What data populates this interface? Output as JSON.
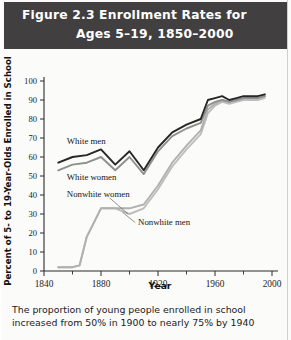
{
  "figure": {
    "title_line1": "Figure 2.3  Enrollment Rates for",
    "title_line2": "Ages 5–19, 1850–2000",
    "caption_line1": "The proportion of young people enrolled in school",
    "caption_line2": "increased from 50% in 1900 to nearly 75% by 1940",
    "header_bg": "#413f3f",
    "header_fg": "#ffffff"
  },
  "chart_data": {
    "type": "line",
    "title": "Figure 2.3  Enrollment Rates for Ages 5–19, 1850–2000",
    "xlabel": "Year",
    "ylabel": "Percent of 5- to 19-Year-Olds Enrolled in School",
    "xlim": [
      1840,
      2000
    ],
    "ylim": [
      0,
      100
    ],
    "xticks": [
      1840,
      1880,
      1920,
      1960,
      2000
    ],
    "xticks_minor": [
      1860,
      1900,
      1940,
      1980
    ],
    "yticks": [
      0,
      10,
      20,
      30,
      40,
      50,
      60,
      70,
      80,
      90,
      100
    ],
    "grid": false,
    "legend": "inline-labels",
    "series": [
      {
        "name": "White men",
        "color": "#262626",
        "width": 1.9,
        "x": [
          1850,
          1860,
          1870,
          1880,
          1890,
          1900,
          1910,
          1920,
          1930,
          1940,
          1950,
          1955,
          1960,
          1965,
          1970,
          1975,
          1980,
          1985,
          1990,
          1995
        ],
        "y": [
          57,
          60,
          61,
          64,
          56,
          63,
          53,
          65,
          73,
          77,
          80,
          90,
          91,
          92,
          90,
          91,
          92,
          92,
          92,
          93
        ]
      },
      {
        "name": "White women",
        "color": "#8f8f8f",
        "width": 1.9,
        "x": [
          1850,
          1860,
          1870,
          1880,
          1890,
          1900,
          1910,
          1920,
          1930,
          1940,
          1950,
          1955,
          1960,
          1965,
          1970,
          1975,
          1980,
          1985,
          1990,
          1995
        ],
        "y": [
          53,
          56,
          57,
          60,
          53,
          60,
          51,
          63,
          71,
          75,
          78,
          87,
          89,
          90,
          89,
          90,
          91,
          91,
          91,
          92
        ]
      },
      {
        "name": "Nonwhite women",
        "color": "#b0b0b0",
        "width": 1.9,
        "x": [
          1850,
          1860,
          1865,
          1870,
          1880,
          1890,
          1900,
          1910,
          1920,
          1930,
          1940,
          1950,
          1955,
          1960,
          1965,
          1970,
          1975,
          1980,
          1985,
          1990,
          1995
        ],
        "y": [
          2,
          2,
          3,
          18,
          33,
          33,
          33,
          35,
          45,
          57,
          66,
          74,
          85,
          88,
          90,
          89,
          90,
          91,
          91,
          91,
          92
        ]
      },
      {
        "name": "Nonwhite men",
        "color": "#bdbdbd",
        "width": 1.9,
        "x": [
          1850,
          1860,
          1865,
          1870,
          1880,
          1890,
          1900,
          1910,
          1920,
          1930,
          1940,
          1950,
          1955,
          1960,
          1965,
          1970,
          1975,
          1980,
          1985,
          1990,
          1995
        ],
        "y": [
          2,
          2,
          3,
          18,
          33,
          33,
          30,
          33,
          43,
          55,
          64,
          72,
          83,
          87,
          89,
          88,
          89,
          90,
          90,
          90,
          91
        ]
      }
    ],
    "annotations": [
      {
        "text": "White men",
        "x": 1856,
        "y": 67
      },
      {
        "text": "White women",
        "x": 1856,
        "y": 48
      },
      {
        "text": "Nonwhite women",
        "x": 1856,
        "y": 39
      },
      {
        "text": "Nonwhite men",
        "x": 1906,
        "y": 24
      }
    ]
  }
}
